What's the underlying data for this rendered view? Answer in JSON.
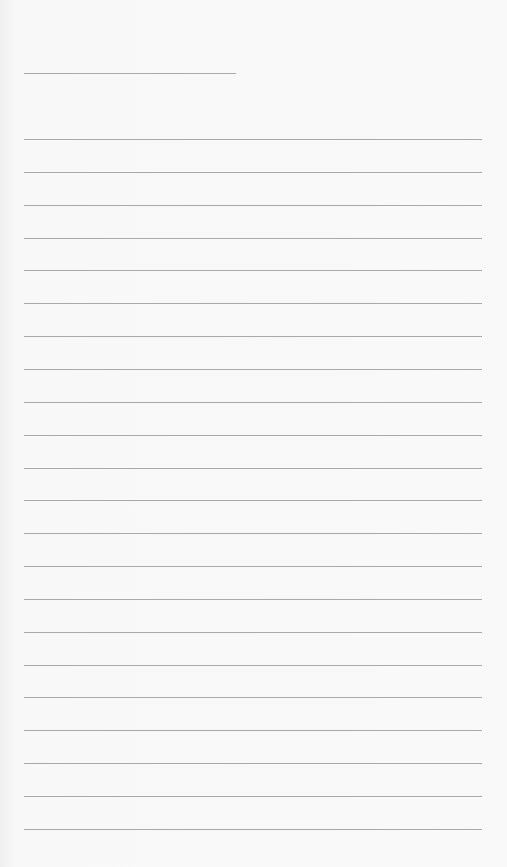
{
  "page": {
    "type": "lined-paper",
    "background_color": "#f7f7f7",
    "line_color": "#a9a9a9",
    "header_line": {
      "top": 73,
      "left": 24,
      "width": 212
    },
    "ruled_lines": {
      "count": 22,
      "first_top": 139,
      "spacing": 32.85,
      "left": 24,
      "width": 458
    }
  }
}
